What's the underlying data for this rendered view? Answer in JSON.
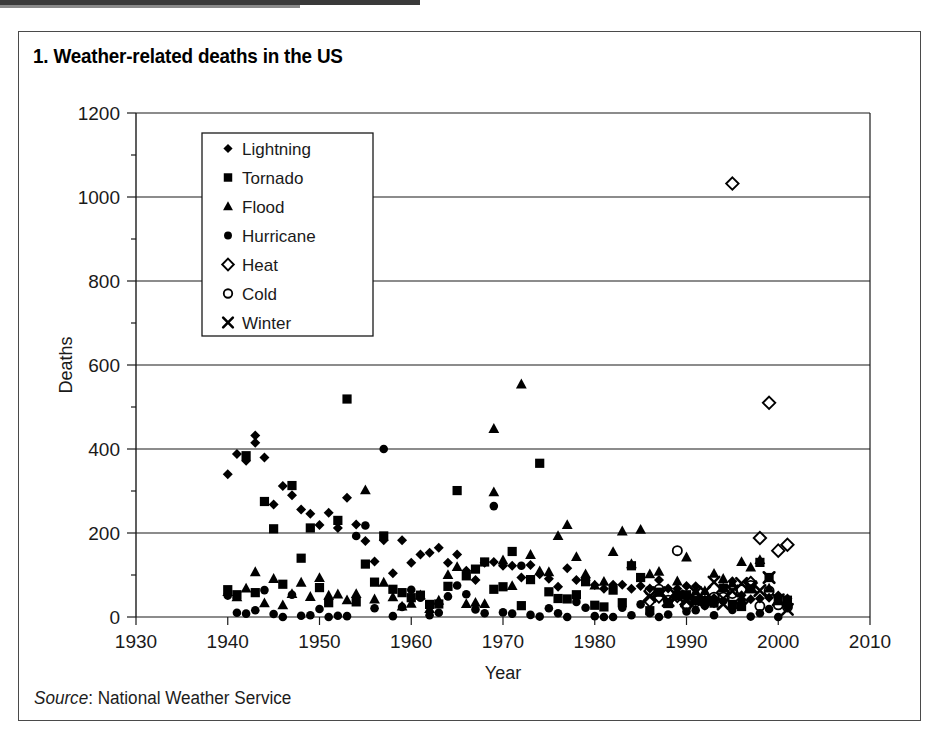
{
  "figure": {
    "number_label": "1.",
    "title": "1.  Weather-related deaths in the US",
    "source_label": "Source",
    "source_sep": ": ",
    "source_value": "National Weather Service",
    "border_color": "#4a4a4a",
    "background": "#ffffff",
    "ink_color": "#000000"
  },
  "chart_data": {
    "type": "scatter",
    "title": "Weather-related deaths in the US",
    "xlabel": "Year",
    "ylabel": "Deaths",
    "xlim": [
      1930,
      2010
    ],
    "ylim": [
      0,
      1200
    ],
    "xticks": [
      1930,
      1940,
      1950,
      1960,
      1970,
      1980,
      1990,
      2000,
      2010
    ],
    "yticks": [
      0,
      200,
      400,
      600,
      800,
      1000,
      1200
    ],
    "y_minor_tick_step": 100,
    "grid": "horizontal",
    "legend_position": "upper-left-inside",
    "source": "National Weather Service",
    "series": [
      {
        "name": "Lightning",
        "marker": "filled-diamond",
        "color": "#000000",
        "points": [
          [
            1940,
            340
          ],
          [
            1941,
            388
          ],
          [
            1942,
            372
          ],
          [
            1943,
            432
          ],
          [
            1943,
            415
          ],
          [
            1944,
            380
          ],
          [
            1945,
            268
          ],
          [
            1946,
            312
          ],
          [
            1947,
            290
          ],
          [
            1948,
            256
          ],
          [
            1949,
            246
          ],
          [
            1950,
            219
          ],
          [
            1951,
            248
          ],
          [
            1952,
            212
          ],
          [
            1953,
            284
          ],
          [
            1954,
            220
          ],
          [
            1955,
            181
          ],
          [
            1956,
            132
          ],
          [
            1957,
            183
          ],
          [
            1958,
            104
          ],
          [
            1959,
            183
          ],
          [
            1960,
            129
          ],
          [
            1961,
            149
          ],
          [
            1962,
            153
          ],
          [
            1963,
            165
          ],
          [
            1964,
            129
          ],
          [
            1965,
            149
          ],
          [
            1966,
            110
          ],
          [
            1967,
            88
          ],
          [
            1968,
            129
          ],
          [
            1969,
            131
          ],
          [
            1970,
            122
          ],
          [
            1971,
            122
          ],
          [
            1972,
            94
          ],
          [
            1973,
            124
          ],
          [
            1974,
            102
          ],
          [
            1975,
            91
          ],
          [
            1976,
            72
          ],
          [
            1977,
            116
          ],
          [
            1978,
            88
          ],
          [
            1979,
            87
          ],
          [
            1980,
            76
          ],
          [
            1981,
            67
          ],
          [
            1982,
            77
          ],
          [
            1983,
            77
          ],
          [
            1984,
            67
          ],
          [
            1985,
            74
          ],
          [
            1986,
            68
          ],
          [
            1987,
            88
          ],
          [
            1988,
            68
          ],
          [
            1989,
            67
          ],
          [
            1990,
            74
          ],
          [
            1991,
            73
          ],
          [
            1992,
            41
          ],
          [
            1993,
            43
          ],
          [
            1994,
            69
          ],
          [
            1995,
            85
          ],
          [
            1996,
            52
          ],
          [
            1997,
            42
          ],
          [
            1998,
            44
          ],
          [
            1999,
            46
          ],
          [
            2000,
            51
          ],
          [
            2001,
            44
          ]
        ]
      },
      {
        "name": "Tornado",
        "marker": "filled-square",
        "color": "#000000",
        "points": [
          [
            1940,
            65
          ],
          [
            1941,
            53
          ],
          [
            1942,
            384
          ],
          [
            1943,
            58
          ],
          [
            1944,
            275
          ],
          [
            1945,
            210
          ],
          [
            1946,
            78
          ],
          [
            1947,
            313
          ],
          [
            1948,
            140
          ],
          [
            1949,
            212
          ],
          [
            1950,
            70
          ],
          [
            1951,
            34
          ],
          [
            1952,
            230
          ],
          [
            1953,
            519
          ],
          [
            1954,
            36
          ],
          [
            1955,
            126
          ],
          [
            1956,
            83
          ],
          [
            1957,
            193
          ],
          [
            1958,
            66
          ],
          [
            1959,
            58
          ],
          [
            1960,
            46
          ],
          [
            1961,
            52
          ],
          [
            1962,
            30
          ],
          [
            1963,
            31
          ],
          [
            1964,
            73
          ],
          [
            1965,
            301
          ],
          [
            1966,
            98
          ],
          [
            1967,
            114
          ],
          [
            1968,
            131
          ],
          [
            1969,
            66
          ],
          [
            1970,
            72
          ],
          [
            1971,
            156
          ],
          [
            1972,
            27
          ],
          [
            1973,
            89
          ],
          [
            1974,
            366
          ],
          [
            1975,
            60
          ],
          [
            1976,
            44
          ],
          [
            1977,
            43
          ],
          [
            1978,
            53
          ],
          [
            1979,
            84
          ],
          [
            1980,
            28
          ],
          [
            1981,
            24
          ],
          [
            1982,
            64
          ],
          [
            1983,
            34
          ],
          [
            1984,
            122
          ],
          [
            1985,
            94
          ],
          [
            1986,
            15
          ],
          [
            1987,
            59
          ],
          [
            1988,
            32
          ],
          [
            1989,
            50
          ],
          [
            1990,
            53
          ],
          [
            1991,
            39
          ],
          [
            1992,
            39
          ],
          [
            1993,
            33
          ],
          [
            1994,
            69
          ],
          [
            1995,
            30
          ],
          [
            1996,
            25
          ],
          [
            1997,
            67
          ],
          [
            1998,
            130
          ],
          [
            1999,
            94
          ],
          [
            2000,
            41
          ],
          [
            2001,
            40
          ]
        ]
      },
      {
        "name": "Flood",
        "marker": "filled-triangle",
        "color": "#000000",
        "points": [
          [
            1940,
            60
          ],
          [
            1941,
            47
          ],
          [
            1942,
            68
          ],
          [
            1943,
            107
          ],
          [
            1944,
            33
          ],
          [
            1945,
            91
          ],
          [
            1946,
            28
          ],
          [
            1947,
            55
          ],
          [
            1948,
            82
          ],
          [
            1949,
            48
          ],
          [
            1950,
            93
          ],
          [
            1951,
            51
          ],
          [
            1952,
            54
          ],
          [
            1953,
            40
          ],
          [
            1954,
            55
          ],
          [
            1955,
            302
          ],
          [
            1956,
            42
          ],
          [
            1957,
            82
          ],
          [
            1958,
            47
          ],
          [
            1959,
            25
          ],
          [
            1960,
            32
          ],
          [
            1961,
            52
          ],
          [
            1962,
            19
          ],
          [
            1963,
            39
          ],
          [
            1964,
            100
          ],
          [
            1965,
            119
          ],
          [
            1966,
            31
          ],
          [
            1967,
            34
          ],
          [
            1968,
            31
          ],
          [
            1969,
            297
          ],
          [
            1969,
            448
          ],
          [
            1970,
            135
          ],
          [
            1971,
            74
          ],
          [
            1972,
            554
          ],
          [
            1973,
            148
          ],
          [
            1974,
            109
          ],
          [
            1975,
            107
          ],
          [
            1976,
            193
          ],
          [
            1977,
            219
          ],
          [
            1978,
            143
          ],
          [
            1979,
            102
          ],
          [
            1980,
            75
          ],
          [
            1981,
            84
          ],
          [
            1982,
            155
          ],
          [
            1983,
            204
          ],
          [
            1984,
            126
          ],
          [
            1985,
            208
          ],
          [
            1986,
            102
          ],
          [
            1987,
            108
          ],
          [
            1988,
            31
          ],
          [
            1989,
            85
          ],
          [
            1990,
            142
          ],
          [
            1991,
            61
          ],
          [
            1992,
            62
          ],
          [
            1993,
            103
          ],
          [
            1994,
            91
          ],
          [
            1995,
            80
          ],
          [
            1996,
            131
          ],
          [
            1997,
            118
          ],
          [
            1998,
            136
          ],
          [
            1999,
            68
          ],
          [
            2000,
            38
          ]
        ]
      },
      {
        "name": "Hurricane",
        "marker": "filled-circle",
        "color": "#000000",
        "points": [
          [
            1940,
            51
          ],
          [
            1941,
            10
          ],
          [
            1942,
            8
          ],
          [
            1943,
            16
          ],
          [
            1944,
            64
          ],
          [
            1945,
            7
          ],
          [
            1946,
            0
          ],
          [
            1947,
            53
          ],
          [
            1948,
            3
          ],
          [
            1949,
            4
          ],
          [
            1950,
            19
          ],
          [
            1951,
            0
          ],
          [
            1952,
            3
          ],
          [
            1953,
            2
          ],
          [
            1954,
            193
          ],
          [
            1955,
            218
          ],
          [
            1956,
            21
          ],
          [
            1957,
            400
          ],
          [
            1958,
            2
          ],
          [
            1959,
            24
          ],
          [
            1960,
            65
          ],
          [
            1961,
            46
          ],
          [
            1962,
            4
          ],
          [
            1963,
            10
          ],
          [
            1964,
            49
          ],
          [
            1965,
            75
          ],
          [
            1966,
            54
          ],
          [
            1967,
            18
          ],
          [
            1968,
            9
          ],
          [
            1969,
            264
          ],
          [
            1970,
            11
          ],
          [
            1971,
            8
          ],
          [
            1972,
            122
          ],
          [
            1973,
            5
          ],
          [
            1974,
            1
          ],
          [
            1975,
            21
          ],
          [
            1976,
            9
          ],
          [
            1977,
            0
          ],
          [
            1978,
            36
          ],
          [
            1979,
            22
          ],
          [
            1980,
            2
          ],
          [
            1981,
            0
          ],
          [
            1982,
            0
          ],
          [
            1983,
            22
          ],
          [
            1984,
            4
          ],
          [
            1985,
            30
          ],
          [
            1986,
            9
          ],
          [
            1987,
            0
          ],
          [
            1988,
            6
          ],
          [
            1989,
            56
          ],
          [
            1990,
            13
          ],
          [
            1991,
            16
          ],
          [
            1992,
            27
          ],
          [
            1993,
            4
          ],
          [
            1994,
            38
          ],
          [
            1995,
            17
          ],
          [
            1996,
            37
          ],
          [
            1997,
            1
          ],
          [
            1998,
            9
          ],
          [
            1999,
            19
          ],
          [
            2000,
            0
          ],
          [
            2001,
            24
          ]
        ]
      },
      {
        "name": "Heat",
        "marker": "open-diamond",
        "color": "#000000",
        "points": [
          [
            1986,
            39
          ],
          [
            1987,
            49
          ],
          [
            1988,
            56
          ],
          [
            1989,
            50
          ],
          [
            1990,
            30
          ],
          [
            1991,
            44
          ],
          [
            1992,
            33
          ],
          [
            1993,
            39
          ],
          [
            1994,
            59
          ],
          [
            1995,
            1032
          ],
          [
            1996,
            36
          ],
          [
            1997,
            81
          ],
          [
            1998,
            188
          ],
          [
            1999,
            510
          ],
          [
            2000,
            158
          ],
          [
            2001,
            172
          ]
        ]
      },
      {
        "name": "Cold",
        "marker": "open-circle",
        "color": "#000000",
        "points": [
          [
            1986,
            62
          ],
          [
            1987,
            66
          ],
          [
            1988,
            40
          ],
          [
            1989,
            158
          ],
          [
            1990,
            26
          ],
          [
            1991,
            36
          ],
          [
            1992,
            35
          ],
          [
            1993,
            47
          ],
          [
            1994,
            47
          ],
          [
            1995,
            56
          ],
          [
            1996,
            65
          ],
          [
            1997,
            75
          ],
          [
            1998,
            26
          ],
          [
            1999,
            62
          ],
          [
            2000,
            29
          ],
          [
            2001,
            24
          ]
        ]
      },
      {
        "name": "Winter",
        "marker": "cross-x",
        "color": "#000000",
        "points": [
          [
            1986,
            49
          ],
          [
            1987,
            58
          ],
          [
            1988,
            39
          ],
          [
            1989,
            50
          ],
          [
            1990,
            38
          ],
          [
            1991,
            58
          ],
          [
            1992,
            60
          ],
          [
            1993,
            83
          ],
          [
            1994,
            31
          ],
          [
            1995,
            62
          ],
          [
            1996,
            80
          ],
          [
            1997,
            72
          ],
          [
            1998,
            63
          ],
          [
            1999,
            94
          ],
          [
            2000,
            41
          ],
          [
            2001,
            18
          ]
        ]
      }
    ]
  },
  "legend": {
    "items": [
      {
        "label": "Lightning",
        "marker": "filled-diamond"
      },
      {
        "label": "Tornado",
        "marker": "filled-square"
      },
      {
        "label": "Flood",
        "marker": "filled-triangle"
      },
      {
        "label": "Hurricane",
        "marker": "filled-circle"
      },
      {
        "label": "Heat",
        "marker": "open-diamond"
      },
      {
        "label": "Cold",
        "marker": "open-circle"
      },
      {
        "label": "Winter",
        "marker": "cross-x"
      }
    ]
  }
}
